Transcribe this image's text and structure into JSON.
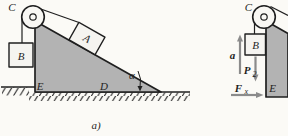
{
  "figure": {
    "caption": "a)",
    "colors": {
      "background": "#fbfaf6",
      "wedge_fill": "#b3b3b3",
      "block_fill": "#f5f4f0",
      "outline": "#1f1f1f",
      "arrow_gray": "#8b8b8b"
    },
    "left_diagram": {
      "pulley_point": "C",
      "incline_block": "A",
      "hanging_block": "B",
      "corner_point": "E",
      "base_point": "D",
      "incline_angle": "α"
    },
    "right_diagram": {
      "pulley_point": "C",
      "hanging_block": "B",
      "corner_point": "E",
      "acceleration": "a",
      "weight_main": "P",
      "weight_sub": "2",
      "force_main": "F",
      "force_sub": "x"
    }
  }
}
